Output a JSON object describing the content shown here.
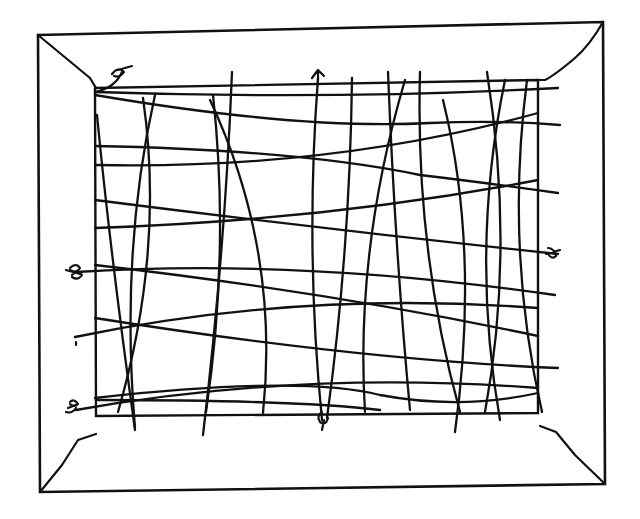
{
  "figure": {
    "stroke_color": "#111111",
    "background": "#ffffff",
    "outer_frame": [
      [
        38,
        35
      ],
      [
        603,
        22
      ],
      [
        605,
        484
      ],
      [
        40,
        492
      ]
    ],
    "inner_frame": [
      [
        95,
        88
      ],
      [
        538,
        80
      ],
      [
        538,
        413
      ],
      [
        96,
        416
      ]
    ],
    "bevels": [
      "M38 35 L90 78 L96 88",
      "M603 22 Q590 45 575 58 Q555 75 545 80 L538 80",
      "M40 492 L62 465 L78 440 L96 434",
      "M605 484 L575 455 L556 432 L540 426"
    ],
    "warp_strings": [
      "M97 115 Q110 250 135 430",
      "M143 98 Q165 250 118 412",
      "M155 95 Q120 250 135 428",
      "M213 95 Q230 250 206 412",
      "M232 72 Q225 250 203 435",
      "M210 100 Q280 250 263 413",
      "M318 78 Q305 250 322 420",
      "M352 78 Q350 250 327 418",
      "M388 72 Q395 250 410 410",
      "M405 80 Q355 250 365 412",
      "M420 72 Q415 250 460 412",
      "M443 100 Q480 250 455 432",
      "M487 72 Q515 250 485 412",
      "M505 80 Q470 250 500 420",
      "M527 80 Q505 250 542 412"
    ],
    "weft_strings": [
      "M95 92 Q330 100 558 88",
      "M95 95 Q300 130 430 123 Q500 120 560 125",
      "M95 146 Q300 150 420 175 Q480 182 558 193",
      "M95 165 Q330 170 538 113",
      "M95 200 Q330 230 558 254",
      "M95 228 Q330 220 538 180",
      "M76 272 Q300 258 555 295",
      "M95 265 Q330 292 538 336",
      "M75 337 Q300 290 538 308",
      "M95 318 Q360 360 558 368",
      "M76 410 Q300 370 538 388",
      "M95 398 Q300 375 380 395 Q460 410 538 393",
      "M98 400 Q300 400 380 410"
    ],
    "knots": [
      {
        "name": "knot-top-left",
        "path": "M95 92 Q115 88 122 72 M112 74 q6 -8 12 -2 q-4 6 -10 4 M118 70 l14 -4"
      },
      {
        "name": "knot-top-center",
        "path": "M312 78 l6 -8 l6 6 M318 70 l0 10"
      },
      {
        "name": "knot-left",
        "path": "M70 268 q6 -6 10 0 q-4 6 -10 2 M72 275 q6 -6 10 0 q-4 6 -10 2 M66 270 l14 4"
      },
      {
        "name": "knot-left-tick",
        "path": "M76 342 l0 3"
      },
      {
        "name": "knot-bottom-left",
        "path": "M68 408 l10 -4 M70 402 q4 -4 8 2 q-4 4 -8 0 M66 412 q6 2 10 -4"
      },
      {
        "name": "knot-bottom-center",
        "path": "M322 412 q-6 4 -2 10 q6 4 8 -4 M324 420 l-2 10"
      },
      {
        "name": "knot-right",
        "path": "M546 254 l14 -4 M548 248 q6 0 8 8 q-4 4 -8 -2"
      }
    ]
  }
}
